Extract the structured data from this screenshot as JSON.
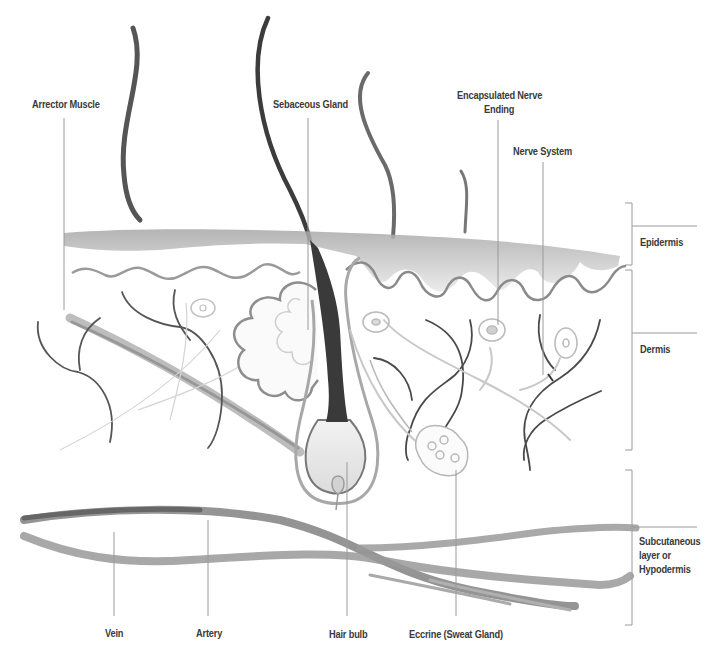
{
  "diagram": {
    "top_labels": {
      "arrector_muscle": "Arrector Muscle",
      "sebaceous_gland": "Sebaceous Gland",
      "encapsulated_nerve_ending_line1": "Encapsulated Nerve",
      "encapsulated_nerve_ending_line2": "Ending",
      "nerve_system": "Nerve System"
    },
    "layer_labels": {
      "epidermis": "Epidermis",
      "dermis": "Dermis",
      "subcutaneous_line1": "Subcutaneous",
      "subcutaneous_line2": "layer or",
      "subcutaneous_line3": "Hypodermis"
    },
    "bottom_labels": {
      "vein": "Vein",
      "artery": "Artery",
      "hair_bulb": "Hair bulb",
      "eccrine": "Eccrine (Sweat Gland)"
    },
    "colors": {
      "ink_dark": "#2e2e2e",
      "ink_mid": "#6a6a6a",
      "ink_light": "#b5b5b5",
      "leader_line": "#8a8a8a",
      "text": "#3a3a3a"
    }
  }
}
